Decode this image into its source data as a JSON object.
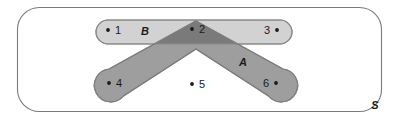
{
  "diagram": {
    "type": "venn-diagram",
    "title": "",
    "universe": {
      "label": "S",
      "name": "universal-set",
      "color": "#ffffff",
      "stroke": "#7a7a7a"
    },
    "sets": [
      {
        "id": "B",
        "label": "B",
        "shape": "rounded-bar",
        "color": "#d2d2d2",
        "members": [
          "1",
          "2",
          "3"
        ]
      },
      {
        "id": "A",
        "label": "A",
        "shape": "chevron",
        "color": "#9e9e9e",
        "members": [
          "2",
          "4",
          "6"
        ]
      }
    ],
    "intersection": {
      "label": "A ∩ B",
      "color": "#7a7a7a",
      "members": [
        "2"
      ]
    },
    "points": [
      {
        "id": "p1",
        "label": "1",
        "dot_side": "left",
        "x": 108,
        "y": 31,
        "region": "B-only"
      },
      {
        "id": "p2",
        "label": "2",
        "dot_side": "left",
        "x": 192,
        "y": 30,
        "region": "A-and-B"
      },
      {
        "id": "p3",
        "label": "3",
        "dot_side": "right",
        "x": 277,
        "y": 31,
        "region": "B-only"
      },
      {
        "id": "p4",
        "label": "4",
        "dot_side": "left",
        "x": 109,
        "y": 84,
        "region": "A-only"
      },
      {
        "id": "p5",
        "label": "5",
        "dot_side": "left",
        "x": 192,
        "y": 85,
        "region": "outside"
      },
      {
        "id": "p6",
        "label": "6",
        "dot_side": "right",
        "x": 276,
        "y": 84,
        "region": "A-only"
      }
    ],
    "labels": {
      "set_b": "B",
      "set_a": "A",
      "universe": "S"
    }
  }
}
